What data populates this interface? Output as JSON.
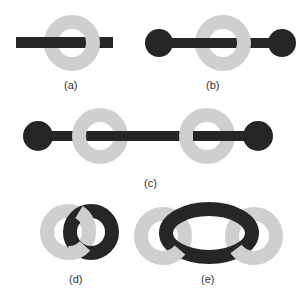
{
  "figure": {
    "colors": {
      "dark": "#262626",
      "light": "#cfcfcf",
      "background": "#ffffff",
      "label": "#333333"
    },
    "panels": [
      {
        "id": "a",
        "label": "(a)",
        "description": "Bar threaded through single ring"
      },
      {
        "id": "b",
        "label": "(b)",
        "description": "Dumbbell threaded through single ring"
      },
      {
        "id": "c",
        "label": "(c)",
        "description": "Long dumbbell threaded through two rings"
      },
      {
        "id": "d",
        "label": "(d)",
        "description": "Two interlocked rings"
      },
      {
        "id": "e",
        "label": "(e)",
        "description": "Elongated dark ring interlocked with two light rings"
      }
    ]
  }
}
